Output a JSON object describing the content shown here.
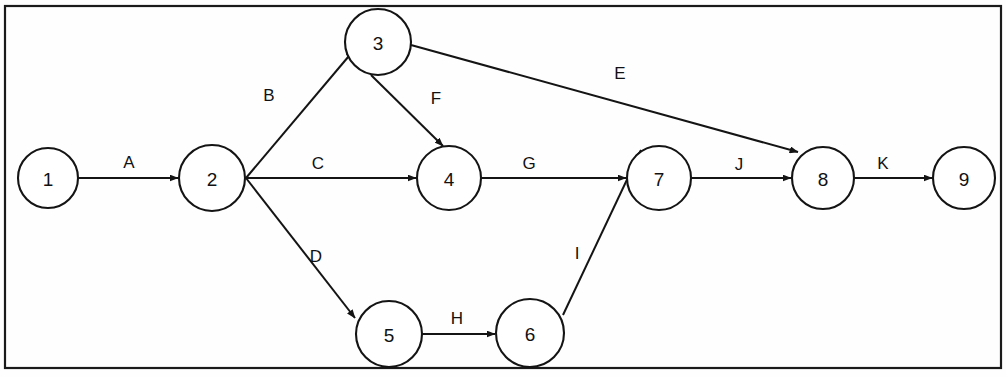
{
  "diagram": {
    "type": "directed-graph",
    "width": 1006,
    "height": 377,
    "colors": {
      "background": "#fefefe",
      "stroke": "#141414",
      "node_fill": "#ffffff",
      "frame": "#1a1a1a"
    },
    "frame": {
      "x": 5,
      "y": 6,
      "width": 996,
      "height": 362
    },
    "nodes": [
      {
        "id": "n1",
        "label": "1",
        "cx": 48,
        "cy": 178,
        "r": 30
      },
      {
        "id": "n2",
        "label": "2",
        "cx": 212,
        "cy": 178,
        "r": 33
      },
      {
        "id": "n3",
        "label": "3",
        "cx": 378,
        "cy": 42,
        "r": 33
      },
      {
        "id": "n4",
        "label": "4",
        "cx": 449,
        "cy": 178,
        "r": 32
      },
      {
        "id": "n5",
        "label": "5",
        "cx": 389,
        "cy": 334,
        "r": 33
      },
      {
        "id": "n6",
        "label": "6",
        "cx": 530,
        "cy": 333,
        "r": 34
      },
      {
        "id": "n7",
        "label": "7",
        "cx": 659,
        "cy": 178,
        "r": 32
      },
      {
        "id": "n8",
        "label": "8",
        "cx": 823,
        "cy": 178,
        "r": 31
      },
      {
        "id": "n9",
        "label": "9",
        "cx": 964,
        "cy": 178,
        "r": 31
      }
    ],
    "edges": [
      {
        "id": "eA",
        "label": "A",
        "from": "n1",
        "to": "n2",
        "x1": 79,
        "y1": 178,
        "x2": 178,
        "y2": 178,
        "lx": 129,
        "ly": 162
      },
      {
        "id": "eB",
        "label": "B",
        "from": "n2",
        "to": "n3",
        "x1": 246,
        "y1": 178,
        "x2": 354,
        "y2": 50,
        "lx": 269,
        "ly": 95
      },
      {
        "id": "eC",
        "label": "C",
        "from": "n2",
        "to": "n4",
        "x1": 246,
        "y1": 178,
        "x2": 416,
        "y2": 178,
        "lx": 318,
        "ly": 163
      },
      {
        "id": "eD",
        "label": "D",
        "from": "n2",
        "to": "n5",
        "x1": 246,
        "y1": 178,
        "x2": 355,
        "y2": 318,
        "lx": 316,
        "ly": 256
      },
      {
        "id": "eE",
        "label": "E",
        "from": "n3",
        "to": "n8",
        "x1": 411,
        "y1": 45,
        "x2": 798,
        "y2": 152,
        "lx": 620,
        "ly": 73
      },
      {
        "id": "eF",
        "label": "F",
        "from": "n3",
        "to": "n4",
        "x1": 371,
        "y1": 75,
        "x2": 443,
        "y2": 146,
        "lx": 436,
        "ly": 98
      },
      {
        "id": "eG",
        "label": "G",
        "from": "n4",
        "to": "n7",
        "x1": 482,
        "y1": 178,
        "x2": 626,
        "y2": 178,
        "lx": 529,
        "ly": 163
      },
      {
        "id": "eH",
        "label": "H",
        "from": "n5",
        "to": "n6",
        "x1": 422,
        "y1": 334,
        "x2": 495,
        "y2": 334,
        "lx": 457,
        "ly": 318
      },
      {
        "id": "eI",
        "label": "I",
        "from": "n6",
        "to": "n7",
        "x1": 563,
        "y1": 315,
        "x2": 641,
        "y2": 150,
        "lx": 577,
        "ly": 253
      },
      {
        "id": "eJ",
        "label": "J",
        "from": "n7",
        "to": "n8",
        "x1": 691,
        "y1": 178,
        "x2": 791,
        "y2": 178,
        "lx": 739,
        "ly": 164
      },
      {
        "id": "eK",
        "label": "K",
        "from": "n8",
        "to": "n9",
        "x1": 855,
        "y1": 178,
        "x2": 932,
        "y2": 178,
        "lx": 883,
        "ly": 163
      }
    ]
  }
}
